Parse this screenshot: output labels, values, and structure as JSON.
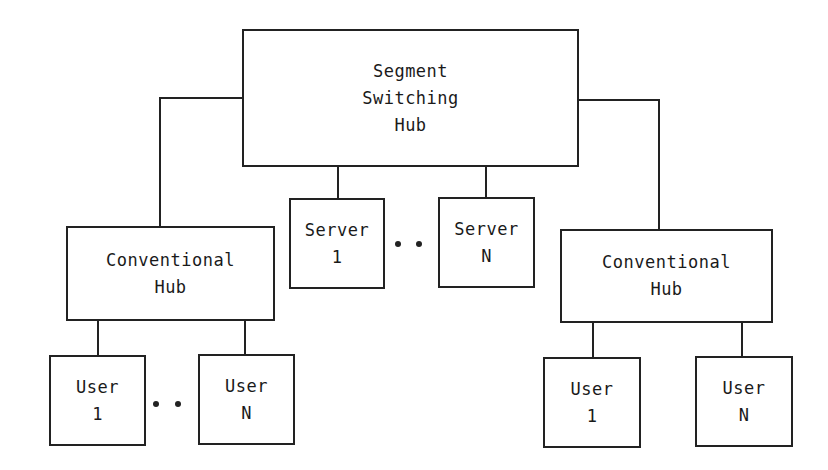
{
  "diagram": {
    "type": "network-topology",
    "colors": {
      "line": "#222222",
      "background": "#ffffff"
    },
    "nodes": {
      "segment_hub": {
        "lines": [
          "Segment",
          "Switching",
          "Hub"
        ]
      },
      "server_1": {
        "lines": [
          "Server",
          "1"
        ]
      },
      "server_n": {
        "lines": [
          "Server",
          "N"
        ]
      },
      "left_hub": {
        "lines": [
          "Conventional",
          "Hub"
        ]
      },
      "right_hub": {
        "lines": [
          "Conventional",
          "Hub"
        ]
      },
      "left_user_1": {
        "lines": [
          "User",
          "1"
        ]
      },
      "left_user_n": {
        "lines": [
          "User",
          "N"
        ]
      },
      "right_user_1": {
        "lines": [
          "User",
          "1"
        ]
      },
      "right_user_n": {
        "lines": [
          "User",
          "N"
        ]
      }
    },
    "ellipses": [
      "• •",
      "• •"
    ],
    "edges": [
      [
        "segment_hub",
        "left_hub"
      ],
      [
        "segment_hub",
        "right_hub"
      ],
      [
        "segment_hub",
        "server_1"
      ],
      [
        "segment_hub",
        "server_n"
      ],
      [
        "left_hub",
        "left_user_1"
      ],
      [
        "left_hub",
        "left_user_n"
      ],
      [
        "right_hub",
        "right_user_1"
      ],
      [
        "right_hub",
        "right_user_n"
      ]
    ]
  }
}
